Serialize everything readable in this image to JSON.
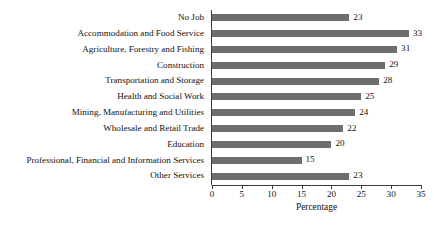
{
  "chart_data": {
    "type": "bar",
    "orientation": "horizontal",
    "title": "",
    "xlabel": "Percentage",
    "ylabel": "",
    "xlim": [
      0,
      35
    ],
    "xticks": [
      0,
      5,
      10,
      15,
      20,
      25,
      30,
      35
    ],
    "grid": false,
    "legend": false,
    "bar_color": "#6e6e6e",
    "axis_color": "#3a3a3a",
    "value_labels": true,
    "categories": [
      "No Job",
      "Accommodation and Food Service",
      "Agriculture, Forestry and Fishing",
      "Construction",
      "Transportation and Storage",
      "Health and Social Work",
      "Mining, Manufacturing and Utilities",
      "Wholesale and Retail Trade",
      "Education",
      "Professional, Financial and Information Services",
      "Other Services"
    ],
    "values": [
      23,
      33,
      31,
      29,
      28,
      25,
      24,
      22,
      20,
      15,
      23
    ],
    "value_text": [
      "23",
      "33",
      "31",
      "29",
      "28",
      "25",
      "24",
      "22",
      "20",
      "15",
      "23"
    ],
    "xtick_labels": [
      "0",
      "5",
      "10",
      "15",
      "20",
      "25",
      "30",
      "35"
    ]
  }
}
